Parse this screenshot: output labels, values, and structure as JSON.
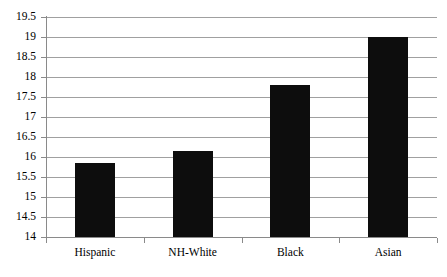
{
  "chart_data": {
    "type": "bar",
    "title": "",
    "subtitle": "",
    "xlabel": "",
    "ylabel": "",
    "categories": [
      "Hispanic",
      "NH-White",
      "Black",
      "Asian"
    ],
    "values": [
      15.85,
      16.15,
      17.8,
      19.0
    ],
    "series": [
      {
        "name": "",
        "values": [
          15.85,
          16.15,
          17.8,
          19.0
        ]
      }
    ],
    "ylim": [
      14,
      19.5
    ],
    "ytick_step": 0.5,
    "ytick_labels": [
      "19.5",
      "19",
      "18.5",
      "18",
      "17.5",
      "17",
      "16.5",
      "16",
      "15.5",
      "15",
      "14.5",
      "14"
    ],
    "ytick_values": [
      19.5,
      19,
      18.5,
      18,
      17.5,
      17,
      16.5,
      16,
      15.5,
      15,
      14.5,
      14
    ],
    "grid": true,
    "grid_axis": "y",
    "legend": false,
    "legend_position": "none",
    "bar_color": "#0d0d0d",
    "grid_color": "#a0a0a0",
    "axis_color": "#8a8a8a",
    "background_color": "#ffffff"
  }
}
